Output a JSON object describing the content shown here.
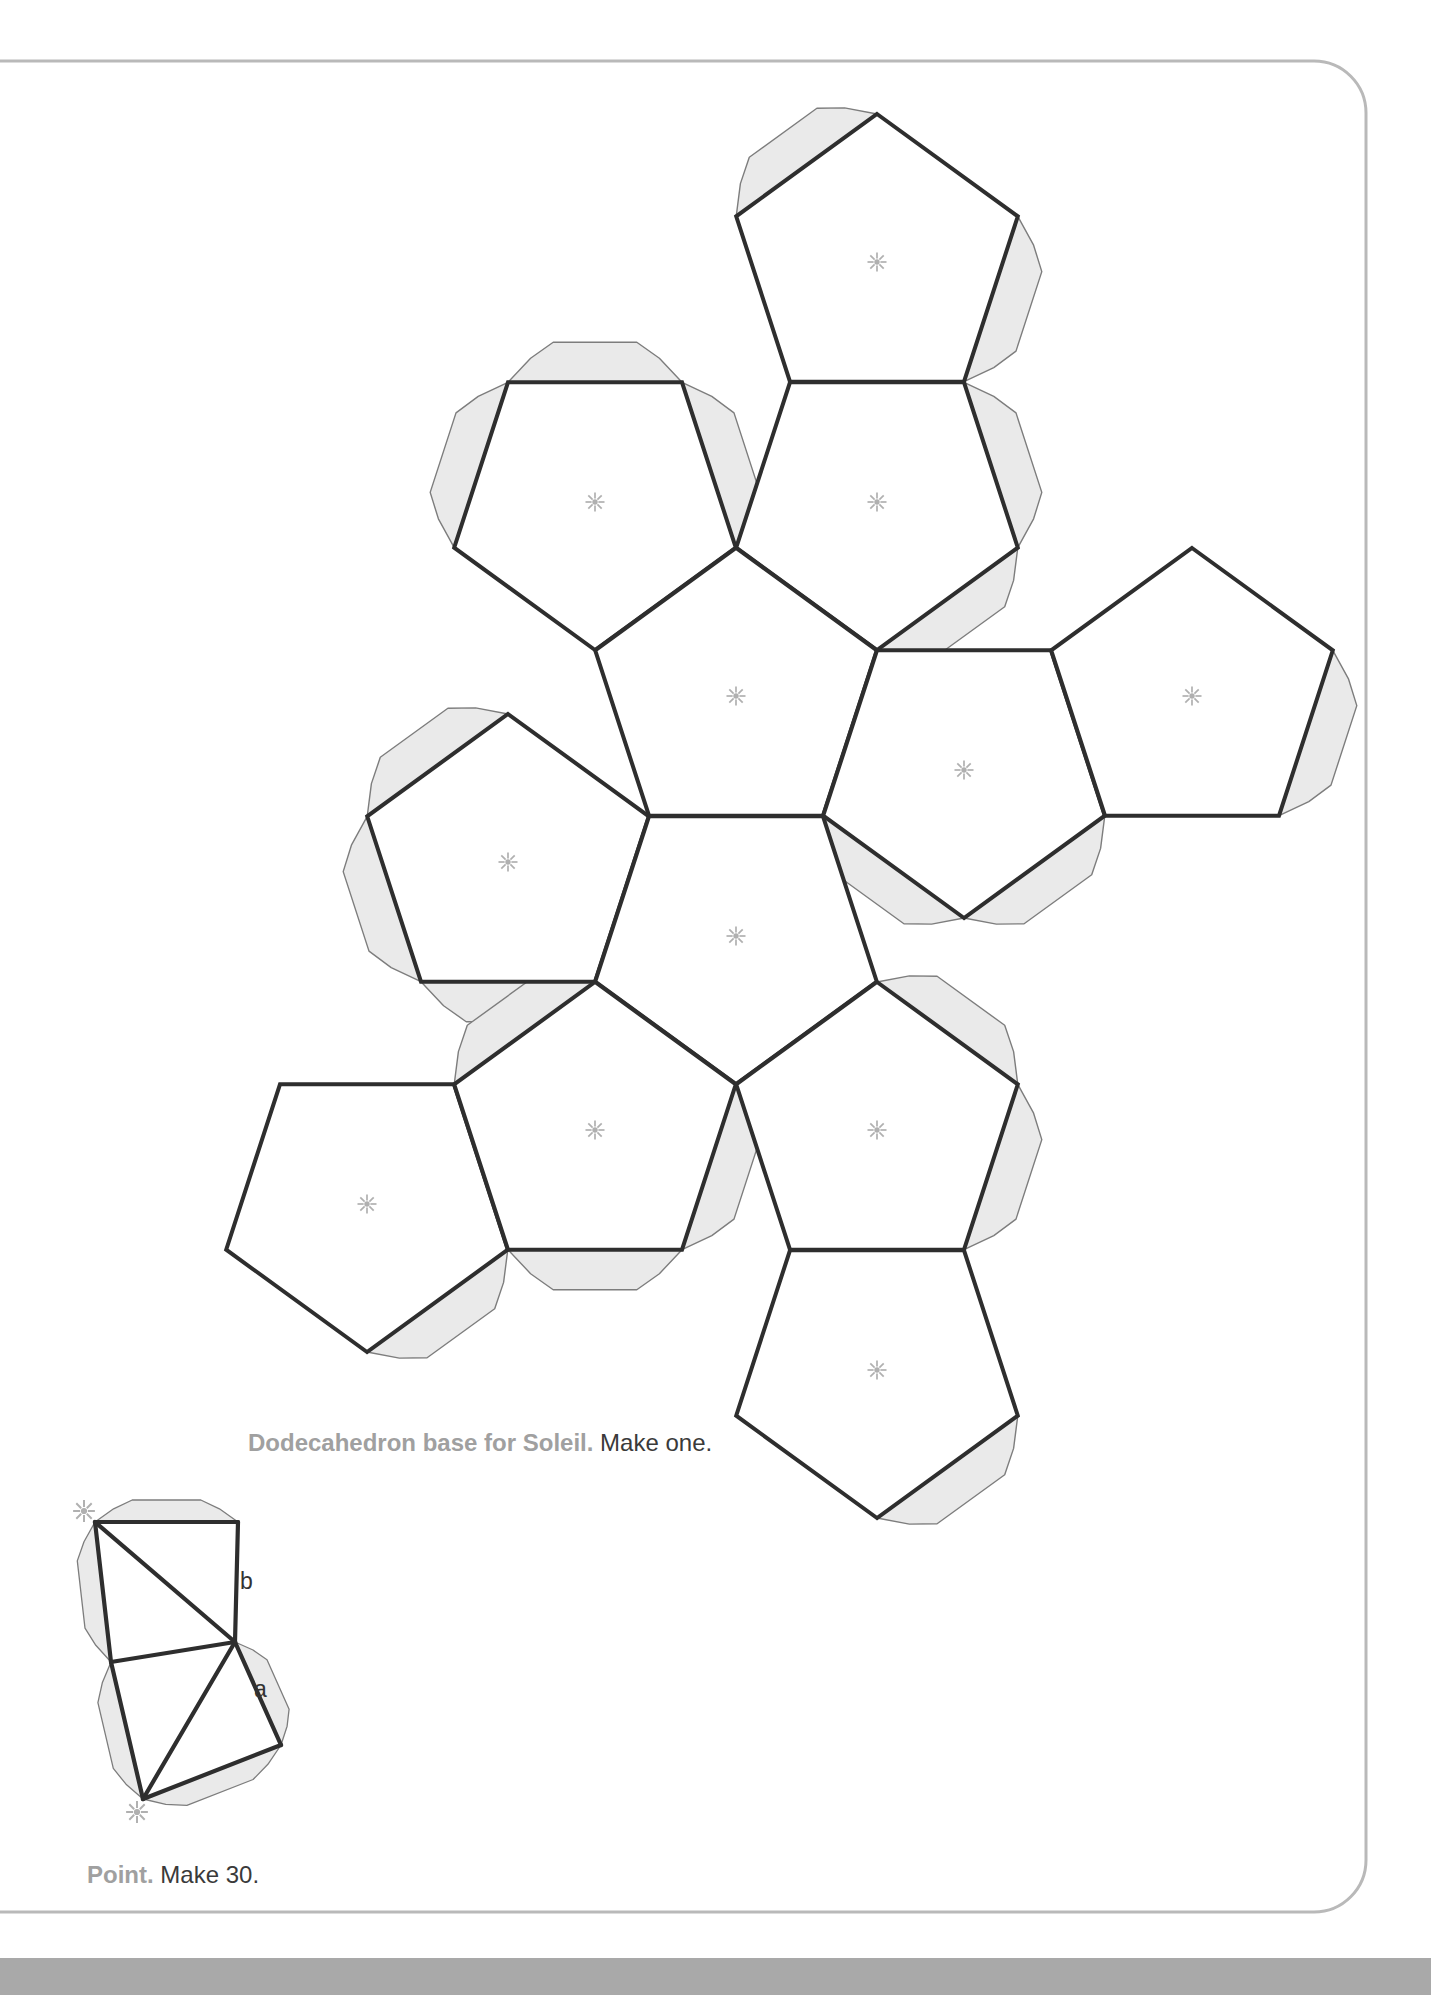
{
  "page": {
    "width": 1431,
    "height": 1995
  },
  "colors": {
    "line": "#2e2e2e",
    "flap_fill": "#eaeaea",
    "flap_stroke": "#7d7d7d",
    "pentagon_fill": "#ffffff",
    "asterisk": "#b0b0b0",
    "page_border": "#b9b9b9",
    "bottom_bar": "#a9a9a9",
    "caption_gray": "#a0a0a0",
    "caption_dark": "#3a3a3a",
    "label_color": "#333333"
  },
  "captions": {
    "dodecahedron": {
      "bold": "Dodecahedron base for Soleil.",
      "regular": "Make one."
    },
    "point": {
      "bold": "Point.",
      "regular": "Make 30."
    }
  },
  "labels": {
    "a": "a",
    "b": "b"
  },
  "geometry": {
    "page_border": {
      "x": -70,
      "y": 61,
      "w": 1436,
      "h": 1851,
      "rx": 52,
      "stroke_width": 3
    },
    "net": {
      "side": 174,
      "circumradius": 148,
      "flap_depth": 40,
      "pentagon_stroke_width": 4,
      "center_mark": "asterisk",
      "pentagons": [
        {
          "id": "p1",
          "cx": 877,
          "cy": 262,
          "orientation": "up",
          "flaps": [
            234,
            18
          ]
        },
        {
          "id": "p2",
          "cx": 877,
          "cy": 502,
          "orientation": "down",
          "flaps": [
            342,
            54
          ]
        },
        {
          "id": "p3",
          "cx": 595,
          "cy": 502,
          "orientation": "down",
          "flaps": [
            270,
            198,
            342
          ]
        },
        {
          "id": "p4",
          "cx": 736,
          "cy": 696,
          "orientation": "up",
          "flaps": []
        },
        {
          "id": "p5",
          "cx": 964,
          "cy": 770,
          "orientation": "down",
          "flaps": [
            126,
            54
          ]
        },
        {
          "id": "p6",
          "cx": 1192,
          "cy": 696,
          "orientation": "up",
          "flaps": [
            18
          ]
        },
        {
          "id": "p7",
          "cx": 508,
          "cy": 862,
          "orientation": "up",
          "flaps": [
            234,
            162,
            90
          ]
        },
        {
          "id": "p8",
          "cx": 736,
          "cy": 936,
          "orientation": "down",
          "flaps": []
        },
        {
          "id": "p9",
          "cx": 367,
          "cy": 1204,
          "orientation": "down",
          "flaps": [
            54
          ]
        },
        {
          "id": "p10",
          "cx": 595,
          "cy": 1130,
          "orientation": "up",
          "flaps": [
            234,
            90,
            18
          ]
        },
        {
          "id": "p11",
          "cx": 877,
          "cy": 1130,
          "orientation": "up",
          "flaps": [
            306,
            18
          ]
        },
        {
          "id": "p12",
          "cx": 877,
          "cy": 1370,
          "orientation": "down",
          "flaps": [
            54
          ]
        }
      ]
    },
    "point_diagram": {
      "edge_stroke_width": 4.2,
      "tab_depth": 22,
      "vertices": {
        "A": [
          95,
          1522
        ],
        "B": [
          238,
          1522
        ],
        "C": [
          235,
          1642
        ],
        "D": [
          111,
          1662
        ],
        "E": [
          281,
          1745
        ],
        "F": [
          143,
          1799
        ]
      },
      "edges": [
        [
          "A",
          "B"
        ],
        [
          "B",
          "C"
        ],
        [
          "A",
          "C"
        ],
        [
          "A",
          "D"
        ],
        [
          "D",
          "C"
        ],
        [
          "C",
          "E"
        ],
        [
          "C",
          "F"
        ],
        [
          "D",
          "F"
        ],
        [
          "E",
          "F"
        ]
      ],
      "tabs": [
        [
          "A",
          "B"
        ],
        [
          "D",
          "A"
        ],
        [
          "C",
          "E"
        ],
        [
          "E",
          "F"
        ],
        [
          "F",
          "D"
        ]
      ],
      "asterisks": [
        [
          84,
          1511
        ],
        [
          137,
          1812
        ]
      ]
    }
  }
}
